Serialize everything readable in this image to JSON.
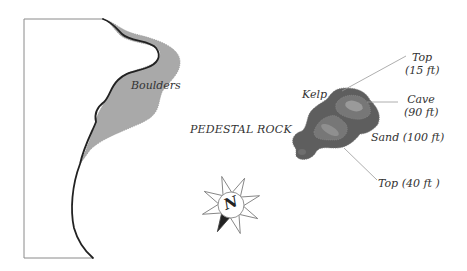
{
  "map": {
    "title": "Pedestal Rock dive site",
    "colors": {
      "boulders_fill": "#a9a9a9",
      "shoreline": "#222222",
      "rock_outer": "#5e5e5e",
      "rock_mid": "#7a7a7a",
      "rock_inner": "#9a9a9a",
      "leader_line": "#999999",
      "label_text": "#333333"
    },
    "labels": {
      "boulders": "Boulders",
      "pedestal_rock": "PEDESTAL ROCK",
      "kelp": "Kelp",
      "top_15_line1": "Top",
      "top_15_line2": "(15 ft)",
      "cave_line1": "Cave",
      "cave_line2": "(90 ft)",
      "sand": "Sand (100 ft)",
      "top_40": "Top (40 ft )"
    },
    "compass": {
      "letter": "N"
    }
  }
}
